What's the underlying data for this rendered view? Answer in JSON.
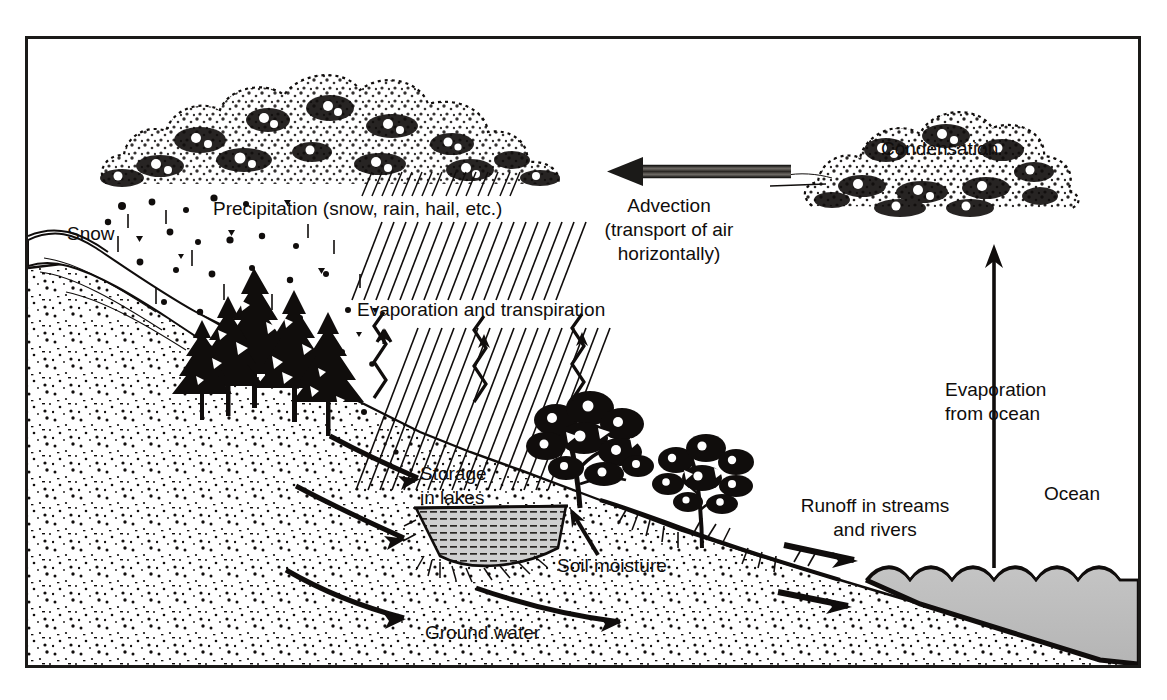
{
  "figure": {
    "frame": {
      "stroke": "#1b1a18",
      "x": 26,
      "y": 37,
      "width": 1114,
      "height": 630
    },
    "background": "#ffffff",
    "ink": "#100d0c",
    "water_fill": "#bdbdbd"
  },
  "labels": {
    "snow": "Snow",
    "precipitation": "Precipitation  (snow, rain, hail, etc.)",
    "evaporation_transpiration": "Evaporation and transpiration",
    "advection_line1": "Advection",
    "advection_line2": "(transport of air",
    "advection_line3": "horizontally)",
    "condensation": "Condensation",
    "evaporation_ocean_line1": "Evaporation",
    "evaporation_ocean_line2": "from ocean",
    "ocean": "Ocean",
    "storage_line1": "Storage",
    "storage_line2": "in lakes",
    "soil_moisture": "Soil moisture",
    "runoff_line1": "Runoff in streams",
    "runoff_line2": "and rivers",
    "ground_water": "Ground water"
  },
  "elements": {
    "rain_cloud": "stippled-cumulus-cloud-left",
    "condensation_cloud": "stippled-cumulus-cloud-right",
    "advection_arrow": "thick-left-arrow",
    "ocean_evaporation_arrow": "thin-up-arrow",
    "evaporation_arrows": "three-zigzag-up-arrows",
    "rain_streaks": "diagonal-hatch-rain-band",
    "conifer_trees": "pine-tree-cluster",
    "deciduous_trees": "broadleaf-tree-cluster",
    "lake": "hatched-gray-lake",
    "ocean_body": "wavy-top-gray-ocean",
    "groundwater_arrows": "curved-subsurface-flow-arrows",
    "runoff_arrows": "two-straight-right-arrows",
    "soil_moisture_arrow": "short-up-arrow",
    "snow_slope": "mountain-snowfield",
    "soil": "stippled-soil-texture"
  }
}
